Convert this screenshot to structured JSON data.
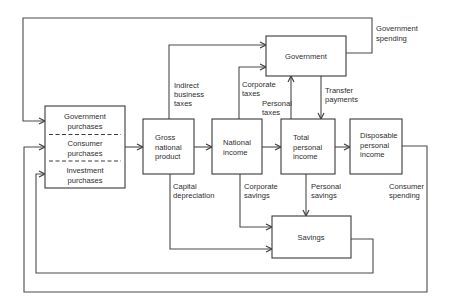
{
  "diagram": {
    "type": "flow",
    "colors": {
      "line": "#4a4a4a",
      "text": "#2e2e2e",
      "background": "#ffffff"
    },
    "boxes": {
      "purchases": {
        "sections": [
          {
            "line1": "Government",
            "line2": "purchases"
          },
          {
            "line1": "Consumer",
            "line2": "purchases"
          },
          {
            "line1": "Investment",
            "line2": "purchases"
          }
        ]
      },
      "gnp": {
        "line1": "Gross",
        "line2": "national",
        "line3": "product"
      },
      "national_income": {
        "line1": "National",
        "line2": "income"
      },
      "total_personal_income": {
        "line1": "Total",
        "line2": "personal",
        "line3": "income"
      },
      "disposable_personal_income": {
        "line1": "Disposable",
        "line2": "personal",
        "line3": "income"
      },
      "government": {
        "label": "Government"
      },
      "savings": {
        "label": "Savings"
      }
    },
    "flows": {
      "government_spending": {
        "line1": "Government",
        "line2": "spending"
      },
      "indirect_business_taxes": {
        "line1": "Indirect",
        "line2": "business",
        "line3": "taxes"
      },
      "corporate_taxes": {
        "line1": "Corporate",
        "line2": "taxes"
      },
      "personal_taxes": {
        "line1": "Personal",
        "line2": "taxes"
      },
      "transfer_payments": {
        "line1": "Transfer",
        "line2": "payments"
      },
      "capital_depreciation": {
        "line1": "Capital",
        "line2": "depreciation"
      },
      "corporate_savings": {
        "line1": "Corporate",
        "line2": "savings"
      },
      "personal_savings": {
        "line1": "Personal",
        "line2": "savings"
      },
      "consumer_spending": {
        "line1": "Consumer",
        "line2": "spending"
      }
    }
  }
}
